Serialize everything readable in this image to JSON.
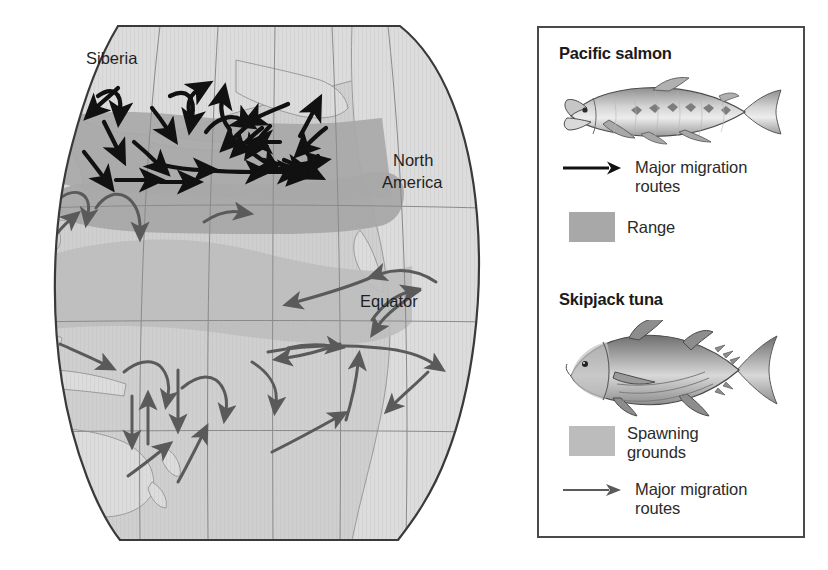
{
  "figure": {
    "type": "thematic-migration-map",
    "region": "Pacific Ocean"
  },
  "map": {
    "labels": [
      {
        "id": "siberia",
        "text": "Siberia",
        "x": 86,
        "y": 64,
        "size": 16.5,
        "color": "#1f1f1f"
      },
      {
        "id": "north-america",
        "text": "North",
        "x": 393,
        "y": 160,
        "size": 16.5,
        "color": "#1f1f1f"
      },
      {
        "id": "north-america2",
        "text": "America",
        "x": 382,
        "y": 182,
        "size": 16.5,
        "color": "#1f1f1f"
      },
      {
        "id": "equator",
        "text": "Equator",
        "x": 360,
        "y": 300,
        "size": 16.5,
        "color": "#1f1f1f"
      }
    ],
    "colors": {
      "ocean": "#cfcfcf",
      "land": "#d9d9d9",
      "salmon_range": "#a8a8a8",
      "tuna_spawning": "#bcbcbc",
      "graticule": "#8a8a8a",
      "outline": "#3a3a3a",
      "coastline": "#9a9a9a",
      "salmon_arrow": "#111111",
      "tuna_arrow": "#5a5a5a"
    },
    "graticule": {
      "parallels_label": [
        "latitude lines"
      ],
      "meridians_label": [
        "longitude lines"
      ],
      "equator_y": 322
    }
  },
  "legend": {
    "border_color": "#4a4a4a",
    "sections": [
      {
        "id": "pacific-salmon",
        "title": "Pacific salmon",
        "fish": "pacific-salmon-illustration",
        "entries": [
          {
            "id": "salmon-routes",
            "symbol": "arrow",
            "symbol_color": "#111111",
            "label_line1": "Major migration",
            "label_line2": "routes"
          },
          {
            "id": "salmon-range",
            "symbol": "swatch",
            "symbol_color": "#a8a8a8",
            "label_line1": "Range",
            "label_line2": ""
          }
        ]
      },
      {
        "id": "skipjack-tuna",
        "title": "Skipjack tuna",
        "fish": "skipjack-tuna-illustration",
        "entries": [
          {
            "id": "tuna-spawning",
            "symbol": "swatch",
            "symbol_color": "#bcbcbc",
            "label_line1": "Spawning",
            "label_line2": "grounds"
          },
          {
            "id": "tuna-routes",
            "symbol": "arrow",
            "symbol_color": "#5a5a5a",
            "label_line1": "Major migration",
            "label_line2": "routes"
          }
        ]
      }
    ]
  }
}
